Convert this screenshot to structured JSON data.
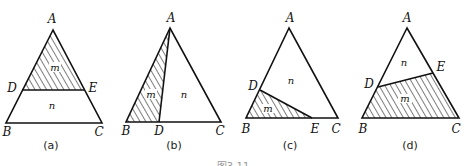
{
  "figure": {
    "caption": "图3-11",
    "panels": [
      {
        "id": "a",
        "label": "(a)",
        "points": {
          "A": "A",
          "B": "B",
          "C": "C",
          "D": "D",
          "E": "E"
        },
        "regions": {
          "shaded": "m",
          "unshaded": "n"
        }
      },
      {
        "id": "b",
        "label": "(b)",
        "points": {
          "A": "A",
          "B": "B",
          "C": "C",
          "D": "D"
        },
        "regions": {
          "shaded": "m",
          "unshaded": "n"
        }
      },
      {
        "id": "c",
        "label": "(c)",
        "points": {
          "A": "A",
          "B": "B",
          "C": "C",
          "D": "D",
          "E": "E"
        },
        "regions": {
          "shaded": "m",
          "unshaded": "n"
        }
      },
      {
        "id": "d",
        "label": "(d)",
        "points": {
          "A": "A",
          "B": "B",
          "C": "C",
          "D": "D",
          "E": "E"
        },
        "regions": {
          "shaded": "m",
          "unshaded": "n"
        }
      }
    ]
  }
}
